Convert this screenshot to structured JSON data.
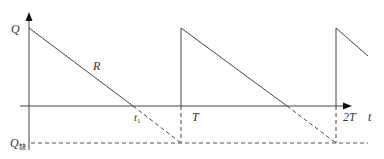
{
  "diagram": {
    "title": "",
    "type": "inventory sawtooth (shortage allowed)",
    "colors": {
      "line": "#444444",
      "text": "#333333",
      "background": "#ffffff"
    },
    "labels": {
      "y_top": "Q",
      "y_bottom_main": "Q",
      "y_bottom_sub": "缺",
      "slope": "R",
      "t1_main": "t",
      "t1_sub": "1",
      "period": "T",
      "period2": "2T",
      "x_axis": "t"
    }
  }
}
